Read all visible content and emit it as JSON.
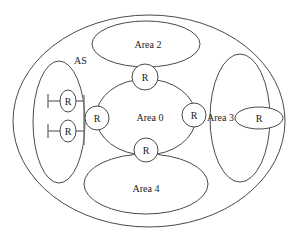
{
  "diagram": {
    "labels": {
      "as": "AS",
      "area0": "Area 0",
      "area2": "Area 2",
      "area3": "Area 3",
      "area4": "Area 4"
    },
    "routers": {
      "top": "R",
      "bottom": "R",
      "left_border": "R",
      "right_border": "R",
      "area3_internal": "R",
      "left_stub_1": "R",
      "left_stub_2": "R"
    },
    "colors": {
      "stroke": "#4a4a4a",
      "text": "#222222",
      "background": "#ffffff"
    }
  }
}
